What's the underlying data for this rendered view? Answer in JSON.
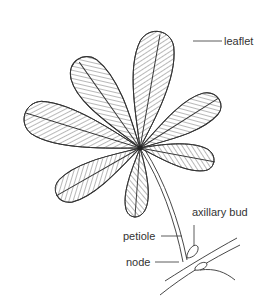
{
  "diagram": {
    "labels": {
      "leaflet": "leaflet",
      "axillary_bud": "axillary bud",
      "petiole": "petiole",
      "node": "node"
    },
    "colors": {
      "stroke": "#333333",
      "background": "#ffffff"
    }
  }
}
